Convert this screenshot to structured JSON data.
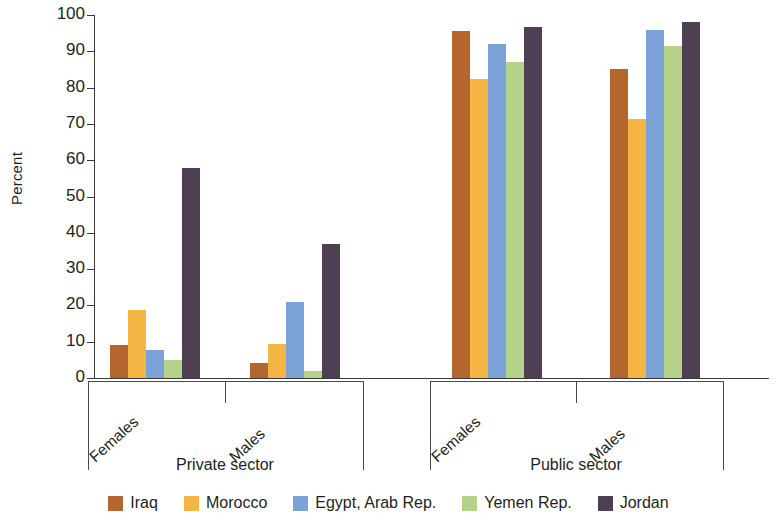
{
  "chart_data": {
    "type": "bar",
    "title": "",
    "xlabel": "",
    "ylabel": "Percent",
    "ylim": [
      0,
      100
    ],
    "ytick_step": 10,
    "yticks": [
      100,
      90,
      80,
      70,
      60,
      50,
      40,
      30,
      20,
      10,
      0
    ],
    "grid": false,
    "legend_position": "bottom",
    "categories": [
      "Private sector - Females",
      "Private sector - Males",
      "Public sector - Females",
      "Public sector - Males"
    ],
    "groups": [
      {
        "sector": "Private sector",
        "subgroups": [
          {
            "label": "Females",
            "values": [
              9.0,
              18.7,
              7.8,
              5.0,
              57.8
            ]
          },
          {
            "label": "Males",
            "values": [
              4.0,
              9.3,
              21.0,
              2.0,
              37.0
            ]
          }
        ]
      },
      {
        "sector": "Public sector",
        "subgroups": [
          {
            "label": "Females",
            "values": [
              95.6,
              82.4,
              92.0,
              87.0,
              96.8
            ]
          },
          {
            "label": "Males",
            "values": [
              85.0,
              71.4,
              96.0,
              91.6,
              98.2
            ]
          }
        ]
      }
    ],
    "series": [
      {
        "name": "Iraq",
        "color": "#b5662f",
        "values": [
          9.0,
          4.0,
          95.6,
          85.0
        ]
      },
      {
        "name": "Morocco",
        "color": "#f5b542",
        "values": [
          18.7,
          9.3,
          82.4,
          71.4
        ]
      },
      {
        "name": "Egypt, Arab Rep.",
        "color": "#7ba3d8",
        "values": [
          7.8,
          21.0,
          92.0,
          96.0
        ]
      },
      {
        "name": "Yemen Rep.",
        "color": "#b5d18a",
        "values": [
          5.0,
          2.0,
          87.0,
          91.6
        ]
      },
      {
        "name": "Jordan",
        "color": "#4f3f52",
        "values": [
          57.8,
          37.0,
          96.8,
          98.2
        ]
      }
    ]
  },
  "axis": {
    "y_label": "Percent"
  },
  "legend": {
    "items": [
      {
        "label": "Iraq",
        "color": "#b5662f"
      },
      {
        "label": "Morocco",
        "color": "#f5b542"
      },
      {
        "label": "Egypt, Arab Rep.",
        "color": "#7ba3d8"
      },
      {
        "label": "Yemen Rep.",
        "color": "#b5d18a"
      },
      {
        "label": "Jordan",
        "color": "#4f3f52"
      }
    ]
  }
}
